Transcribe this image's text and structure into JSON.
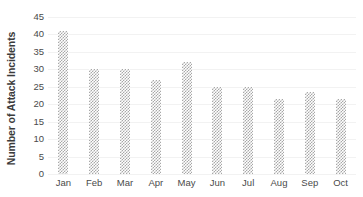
{
  "chart_data": {
    "type": "bar",
    "title": "",
    "subtitle": "",
    "xlabel": "",
    "ylabel": "Number of Attack Incidents",
    "categories": [
      "Jan",
      "Feb",
      "Mar",
      "Apr",
      "May",
      "Jun",
      "Jul",
      "Aug",
      "Sep",
      "Oct"
    ],
    "values": [
      41,
      30,
      30,
      27,
      32,
      25,
      25,
      21.5,
      23.5,
      21.5
    ],
    "ylim": [
      0,
      45
    ],
    "yticks": [
      0,
      5,
      10,
      15,
      20,
      25,
      30,
      35,
      40,
      45
    ],
    "ytick_labels": [
      "0",
      "5",
      "10",
      "15",
      "20",
      "25",
      "30",
      "35",
      "40",
      "45"
    ],
    "grid": true,
    "grid_axis": "y",
    "legend": false,
    "legend_position": "none",
    "bar_fill": "checkerboard-pattern",
    "bar_color": "#a8a8a8",
    "gridline_color": "#f2f2f2",
    "background_color": "#ffffff",
    "text_color": "#4a4a4a"
  }
}
